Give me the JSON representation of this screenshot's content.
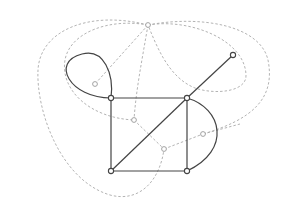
{
  "diagram": {
    "type": "planar-graph-with-dual",
    "colors": {
      "primal_edge": "#444444",
      "dual_edge": "#aaaaaa",
      "vertex_fill": "#ffffff",
      "vertex_stroke": "#444444",
      "dual_vertex_stroke": "#999999",
      "background": "#ffffff"
    },
    "primal_vertices": [
      {
        "id": "A",
        "x": 111,
        "y": 98
      },
      {
        "id": "B",
        "x": 187,
        "y": 98
      },
      {
        "id": "C",
        "x": 111,
        "y": 171
      },
      {
        "id": "D",
        "x": 187,
        "y": 171
      },
      {
        "id": "E",
        "x": 233,
        "y": 55
      }
    ],
    "primal_edges": [
      {
        "id": "AB",
        "d": "M111,98 L187,98"
      },
      {
        "id": "AC",
        "d": "M111,98 L111,171"
      },
      {
        "id": "CD",
        "d": "M111,171 L187,171"
      },
      {
        "id": "BD",
        "d": "M187,98 L187,171"
      },
      {
        "id": "CB",
        "d": "M111,171 L187,98"
      },
      {
        "id": "BE",
        "d": "M187,98 L233,55"
      },
      {
        "id": "BD-arc",
        "d": "M187,98 C222,108 232,150 187,171"
      },
      {
        "id": "A-loop",
        "d": "M111,98 C70,98 50,62 82,54 C104,48 114,74 111,98"
      }
    ],
    "dual_vertices": [
      {
        "id": "outer",
        "x": 148,
        "y": 25
      },
      {
        "id": "loop",
        "x": 95,
        "y": 84
      },
      {
        "id": "tri-upper",
        "x": 134,
        "y": 120
      },
      {
        "id": "tri-lower",
        "x": 164,
        "y": 149
      },
      {
        "id": "lens",
        "x": 203,
        "y": 134
      }
    ],
    "dual_edges": [
      {
        "id": "outer-loop",
        "d": "M148,25 L95,84"
      },
      {
        "id": "outer-tri-upper",
        "d": "M148,25 C142,60 136,90 134,120"
      },
      {
        "id": "outer-around-left",
        "d": "M148,25 C90,10 40,30 38,70 C36,110 60,180 110,195 C140,203 160,180 164,149"
      },
      {
        "id": "outer-around-loop",
        "d": "M148,25 C110,18 70,32 65,60 C60,90 90,118 134,120"
      },
      {
        "id": "outer-around-right",
        "d": "M148,25 C200,15 260,25 268,60 C276,100 250,120 203,134"
      },
      {
        "id": "outer-inner-right",
        "d": "M148,25 C190,18 245,40 246,75 C247,92 215,95 195,88 C170,78 158,50 148,25"
      },
      {
        "id": "tri-upper-tri-lower",
        "d": "M134,120 L164,149"
      },
      {
        "id": "tri-lower-lens",
        "d": "M164,149 L203,134"
      },
      {
        "id": "lens-outer-edge",
        "d": "M203,134 L240,124"
      }
    ]
  }
}
